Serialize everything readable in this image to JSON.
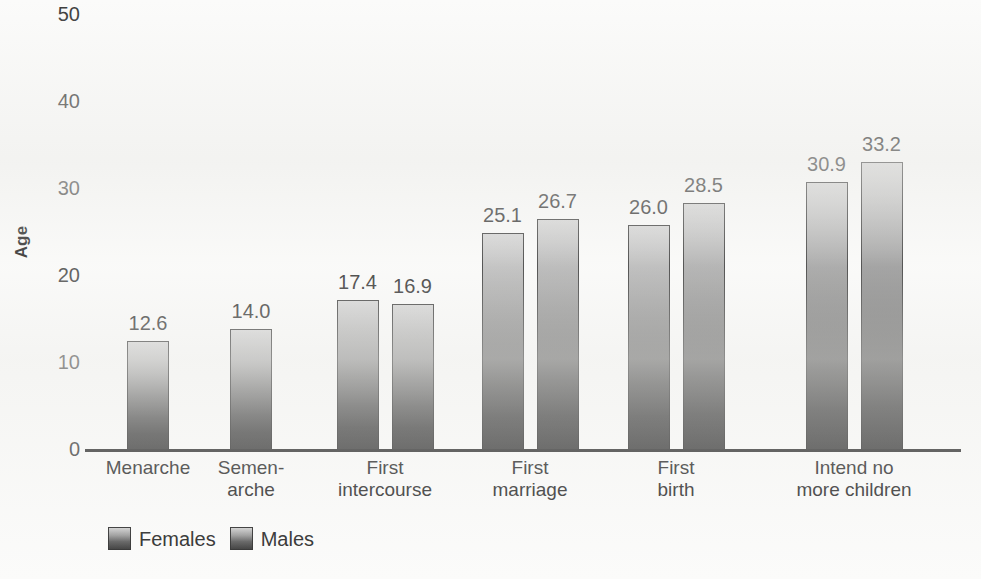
{
  "chart_data": {
    "type": "bar",
    "title": "",
    "subtitle": "",
    "xlabel": "",
    "ylabel": "Age",
    "ylim": [
      0,
      50
    ],
    "yticks": [
      0,
      10,
      20,
      30,
      40,
      50
    ],
    "grid": false,
    "legend_position": "bottom-left",
    "categories": [
      "Menarche",
      "Semen-arche",
      "First intercourse",
      "First marriage",
      "First birth",
      "Intend no more children"
    ],
    "category_lines": [
      [
        "Menarche"
      ],
      [
        "Semen-",
        "arche"
      ],
      [
        "First",
        "intercourse"
      ],
      [
        "First",
        "marriage"
      ],
      [
        "First",
        "birth"
      ],
      [
        "Intend no",
        "more children"
      ]
    ],
    "series": [
      {
        "name": "Females",
        "values": [
          12.6,
          null,
          17.4,
          25.1,
          26.0,
          30.9
        ],
        "labels": [
          "12.6",
          "",
          "17.4",
          "25.1",
          "26.0",
          "30.9"
        ]
      },
      {
        "name": "Males",
        "values": [
          null,
          14.0,
          16.9,
          26.7,
          28.5,
          33.2
        ],
        "labels": [
          "",
          "14.0",
          "16.9",
          "26.7",
          "28.5",
          "33.2"
        ]
      }
    ]
  },
  "axis": {
    "y_title": "Age",
    "y_tick_labels": [
      "50",
      "40",
      "30",
      "20",
      "10",
      "0"
    ]
  },
  "legend": {
    "items": [
      {
        "label": "Females"
      },
      {
        "label": "Males"
      }
    ]
  },
  "colors": {
    "background": "#fbfbfa",
    "bar_top": "#d2d2d2",
    "bar_bottom": "#383838",
    "bar_border": "#2e2e2e",
    "axis": "#2b2b2b",
    "text": "#232323"
  }
}
